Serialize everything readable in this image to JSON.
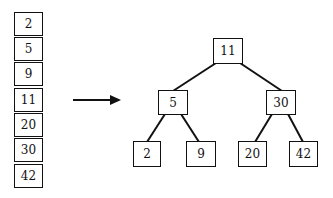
{
  "array": {
    "values": [
      "2",
      "5",
      "9",
      "11",
      "20",
      "30",
      "42"
    ]
  },
  "tree": {
    "root": "11",
    "left": "5",
    "right": "30",
    "left_left": "2",
    "left_right": "9",
    "right_left": "20",
    "right_right": "42"
  },
  "colors": {
    "stroke": "#111111",
    "background": "#ffffff"
  }
}
